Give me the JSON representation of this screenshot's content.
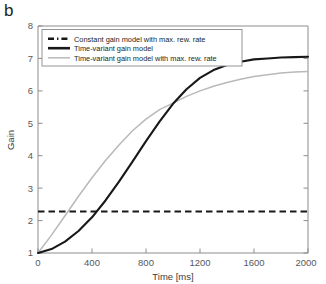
{
  "panel": {
    "label": "b"
  },
  "chart_data": {
    "type": "line",
    "title": "",
    "xlabel": "Time [ms]",
    "ylabel": "Gain",
    "xlim": [
      0,
      2000
    ],
    "ylim": [
      1,
      8
    ],
    "xticks": [
      0,
      400,
      800,
      1200,
      1600,
      2000
    ],
    "yticks": [
      1,
      2,
      3,
      4,
      5,
      6,
      7,
      8
    ],
    "xtick_labels": [
      "0",
      "400",
      "800",
      "1200",
      "1600",
      "2000"
    ],
    "ytick_labels": [
      "1",
      "2",
      "3",
      "4",
      "5",
      "6",
      "7",
      "8"
    ],
    "grid": false,
    "legend_position": "upper left",
    "series": [
      {
        "name": "Constant gain model with max. rew. rate",
        "style": "dash-dot",
        "color": "#181818",
        "x": [
          0,
          200,
          400,
          600,
          800,
          1000,
          1200,
          1400,
          1600,
          1800,
          2000
        ],
        "values": [
          2.28,
          2.28,
          2.28,
          2.28,
          2.28,
          2.28,
          2.28,
          2.28,
          2.28,
          2.28,
          2.28
        ]
      },
      {
        "name": "Time-variant gain model",
        "style": "solid-thick",
        "color": "#181818",
        "x": [
          0,
          100,
          200,
          300,
          400,
          500,
          600,
          700,
          800,
          900,
          1000,
          1100,
          1200,
          1300,
          1400,
          1500,
          1600,
          1700,
          1800,
          1900,
          2000
        ],
        "values": [
          1.0,
          1.12,
          1.35,
          1.68,
          2.1,
          2.62,
          3.2,
          3.82,
          4.45,
          5.05,
          5.6,
          6.05,
          6.4,
          6.64,
          6.8,
          6.9,
          6.97,
          7.0,
          7.03,
          7.04,
          7.05
        ]
      },
      {
        "name": "Time-variant gain model with max. rew. rate",
        "style": "solid-thin",
        "color": "#b9b9b9",
        "x": [
          0,
          100,
          200,
          300,
          400,
          500,
          600,
          700,
          800,
          900,
          1000,
          1100,
          1200,
          1300,
          1400,
          1500,
          1600,
          1700,
          1800,
          1900,
          2000
        ],
        "values": [
          1.0,
          1.55,
          2.15,
          2.75,
          3.32,
          3.85,
          4.33,
          4.77,
          5.13,
          5.42,
          5.62,
          5.83,
          6.0,
          6.14,
          6.26,
          6.36,
          6.44,
          6.5,
          6.55,
          6.58,
          6.6
        ]
      }
    ],
    "annotations": {
      "crossing_point": {
        "x": 1000,
        "y": 5.6
      }
    }
  },
  "legend": {
    "entries": [
      {
        "label": "Constant gain model with max. rew. rate"
      },
      {
        "label": "Time-variant gain model"
      },
      {
        "label": "Time-variant gain model with max. rew. rate"
      }
    ]
  },
  "colors": {
    "black_curve": "#181818",
    "gray_curve": "#b9b9b9",
    "axis": "#8c8c8e",
    "text": "#231f20"
  }
}
